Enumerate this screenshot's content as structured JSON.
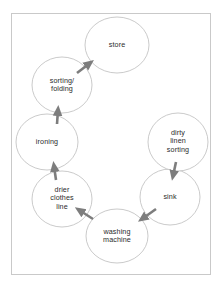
{
  "diagram": {
    "frame": {
      "border_color": "#c9c9c9",
      "background": "#ffffff"
    },
    "style": {
      "node_stroke": "#bdbdbd",
      "node_fill": "#ffffff",
      "text_color": "#2b2b2b",
      "arrow_color": "#7d7d7d",
      "connector_color": "#cfcfcf"
    },
    "nodes": [
      {
        "id": "store",
        "label": "store",
        "cx": 117,
        "cy": 45,
        "rx": 32,
        "ry": 28
      },
      {
        "id": "sorting",
        "label": "sorting/\nfolding",
        "cx": 62,
        "cy": 85,
        "rx": 30,
        "ry": 28
      },
      {
        "id": "ironing",
        "label": "ironing",
        "cx": 47,
        "cy": 142,
        "rx": 31,
        "ry": 28
      },
      {
        "id": "drier",
        "label": "drier\nclothes\nline",
        "cx": 62,
        "cy": 199,
        "rx": 30,
        "ry": 28
      },
      {
        "id": "washing",
        "label": "washing\nmachine",
        "cx": 117,
        "cy": 236,
        "rx": 31,
        "ry": 27
      },
      {
        "id": "sink",
        "label": "sink",
        "cx": 170,
        "cy": 197,
        "rx": 30,
        "ry": 28
      },
      {
        "id": "dirty-linen",
        "label": "dirty\nlinen\nsorting",
        "cx": 178,
        "cy": 142,
        "rx": 30,
        "ry": 29
      }
    ],
    "edges": [
      {
        "id": "dirty-to-sink",
        "from": "dirty-linen",
        "to": "sink",
        "x1": 176,
        "y1": 162,
        "x2": 173,
        "y2": 176
      },
      {
        "id": "sink-to-washing",
        "from": "sink",
        "to": "washing",
        "x1": 156,
        "y1": 209,
        "x2": 142,
        "y2": 219
      },
      {
        "id": "washing-to-drier",
        "from": "washing",
        "to": "drier",
        "x1": 93,
        "y1": 219,
        "x2": 79,
        "y2": 210
      },
      {
        "id": "drier-to-ironing",
        "from": "drier",
        "to": "ironing",
        "x1": 56,
        "y1": 180,
        "x2": 54,
        "y2": 166
      },
      {
        "id": "ironing-to-sorting",
        "from": "ironing",
        "to": "sorting",
        "x1": 57,
        "y1": 124,
        "x2": 58,
        "y2": 110
      },
      {
        "id": "sorting-to-store",
        "from": "sorting",
        "to": "store",
        "x1": 77,
        "y1": 73,
        "x2": 90,
        "y2": 63
      }
    ]
  }
}
